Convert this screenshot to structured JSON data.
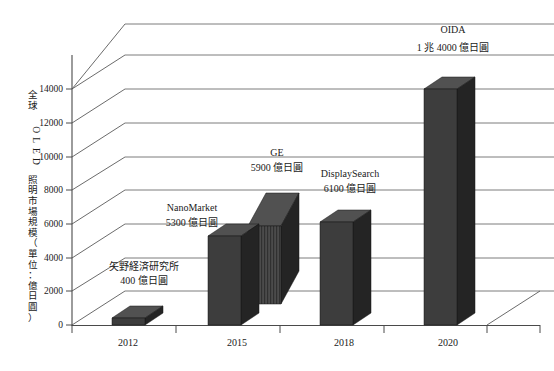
{
  "chart_data": {
    "type": "bar",
    "title": "",
    "subtitle": "",
    "xlabel": "",
    "ylabel": "全球 OLED 照明市場規模（單位：億日圓）",
    "ylim": [
      0,
      16000
    ],
    "ytick_values": [
      0,
      2000,
      4000,
      6000,
      8000,
      10000,
      12000,
      14000
    ],
    "ytick_labels": [
      "0",
      "2000",
      "4000",
      "6000",
      "8000",
      "10000",
      "12000",
      "14000"
    ],
    "categories": [
      "2012",
      "2015",
      "2018",
      "2020"
    ],
    "grid": true,
    "legend": "none",
    "projection": "3d-isometric",
    "unit": "億日圓",
    "points": [
      {
        "category": "2012",
        "source": "矢野経済研究所",
        "value": 400,
        "value_label": "400 億日圓",
        "style": "solid"
      },
      {
        "category": "2015",
        "source": "NanoMarket",
        "value": 5300,
        "value_label": "5300 億日圓",
        "style": "solid"
      },
      {
        "category": "2015",
        "source": "GE",
        "value": 5900,
        "value_label": "5900 億日圓",
        "style": "striped"
      },
      {
        "category": "2018",
        "source": "DisplaySearch",
        "value": 6100,
        "value_label": "6100 億日圓",
        "style": "solid"
      },
      {
        "category": "2020",
        "source": "OIDA",
        "value": 14000,
        "value_label": "1 兆 4000 億日圓",
        "style": "solid"
      }
    ]
  },
  "axis": {
    "ytitle": "全球 OLED 照明市場規模（單位：億日圓）",
    "ytitle_chars": [
      "全",
      "球",
      " ",
      "O",
      "L",
      "E",
      "D",
      " ",
      "照",
      "明",
      "市",
      "場",
      "規",
      "模",
      "（",
      "單",
      "位",
      "：",
      "億",
      "日",
      "圓",
      "）"
    ],
    "yticks": [
      "14000",
      "12000",
      "10000",
      "8000",
      "6000",
      "4000",
      "2000",
      "0"
    ],
    "xticks": [
      "2012",
      "2015",
      "2018",
      "2020"
    ]
  },
  "annotations": {
    "yano": {
      "name": "矢野経済研究所",
      "value": "400 億日圓"
    },
    "nanomarket": {
      "name": "NanoMarket",
      "value": "5300 億日圓"
    },
    "ge": {
      "name": "GE",
      "value": "5900 億日圓"
    },
    "displaysearch": {
      "name": "DisplaySearch",
      "value": "6100 億日圓"
    },
    "oida": {
      "name": "OIDA",
      "value": "1 兆 4000 億日圓"
    }
  },
  "colors": {
    "bar_front": "#3d3d3d",
    "bar_side": "#242424",
    "bar_top": "#515151",
    "axis": "#4a4a4a",
    "grid": "#6d6d6d",
    "background": "#ffffff",
    "text": "#1a1a1a"
  }
}
